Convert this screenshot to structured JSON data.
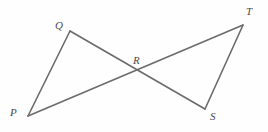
{
  "figure": {
    "type": "geometry-diagram",
    "stroke_color": "#6b6b6b",
    "label_color": "#4a4a4a",
    "background_color": "#fefefe",
    "stroke_width": 1.6,
    "points": {
      "P": {
        "label": "P",
        "x": 28,
        "y": 116
      },
      "Q": {
        "label": "Q",
        "x": 70,
        "y": 31
      },
      "R": {
        "label": "R",
        "x": 138,
        "y": 70
      },
      "S": {
        "label": "S",
        "x": 205,
        "y": 109
      },
      "T": {
        "label": "T",
        "x": 243,
        "y": 25
      }
    },
    "segments": [
      {
        "name": "PQ",
        "from": "P",
        "to": "Q"
      },
      {
        "name": "QS",
        "from": "Q",
        "to": "S"
      },
      {
        "name": "PT",
        "from": "P",
        "to": "T"
      },
      {
        "name": "ST",
        "from": "S",
        "to": "T"
      }
    ],
    "triangles": [
      "PQR",
      "RST"
    ]
  }
}
